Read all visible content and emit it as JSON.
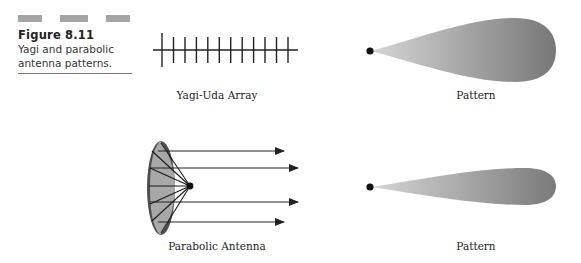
{
  "figure": {
    "number": "Figure 8.11",
    "caption_line1": "Yagi and parabolic",
    "caption_line2": "antenna patterns."
  },
  "panels": {
    "yagi": {
      "label": "Yagi-Uda Array",
      "element_count": 12
    },
    "yagi_pattern": {
      "label": "Pattern"
    },
    "parabolic": {
      "label": "Parabolic Antenna",
      "ray_count": 4
    },
    "parabolic_pattern": {
      "label": "Pattern"
    }
  },
  "colors": {
    "bars": "#a4a4a4",
    "dish_fill": "#a8a8a8",
    "dish_rim": "#555555",
    "pattern_light": "#d2d2d2",
    "pattern_dark": "#7a7a7a",
    "ink": "#222222"
  }
}
